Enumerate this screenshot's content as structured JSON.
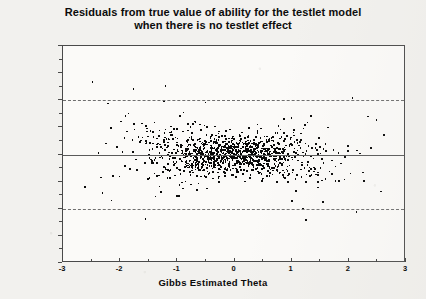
{
  "chart_data": {
    "type": "scatter",
    "title": "Residuals from true value of ability for the testlet model when there is no testlet effect",
    "title_line1": "Residuals from true value of ability for the testlet model",
    "title_line2": "when there is no testlet effect",
    "xlabel": "Gibbs Estimated Theta",
    "ylabel": "Estimated theta MINUS True Theta",
    "xlim": [
      -3,
      3
    ],
    "ylim": [
      -2.0,
      2.0
    ],
    "xticks": [
      -3,
      -2,
      -1,
      0,
      1,
      2,
      3
    ],
    "xticklabels": [
      "-3",
      "-2",
      "-1",
      "0",
      "1",
      "2",
      "3"
    ],
    "yticks": [
      -2.0,
      -1.5,
      -1.0,
      -0.5,
      0.0,
      0.5,
      1.0,
      1.5,
      2.0
    ],
    "yticklabels": [
      "-2.0",
      "-1.5",
      "-1.0",
      "-0.5",
      "0.0",
      "0.5",
      "1.0",
      "1.5",
      "2.0"
    ],
    "x_minor_ticks": [
      -2.5,
      -1.5,
      -0.5,
      0.5,
      1.5,
      2.5
    ],
    "y_minor_ticks": [
      -1.75,
      -1.25,
      -0.75,
      -0.25,
      0.25,
      0.75,
      1.25,
      1.75
    ],
    "grid": false,
    "legend": null,
    "marker": "square",
    "marker_size_px": 1.6,
    "marker_color": "#0a0a0a",
    "reference_lines": [
      {
        "y": 1.0,
        "style": "dashed",
        "color": "#6e6e6e",
        "label": "+1.0 residual band"
      },
      {
        "y": 0.0,
        "style": "solid",
        "color": "#5a5a5a",
        "label": "zero residual"
      },
      {
        "y": -1.0,
        "style": "dashed",
        "color": "#6e6e6e",
        "label": "-1.0 residual band"
      }
    ],
    "n_points": 900,
    "x": [
      -2.62,
      -2.48,
      -2.41,
      -2.33,
      -2.3,
      -2.26,
      -2.22,
      -2.19,
      -2.16,
      -2.12,
      -2.09,
      -2.06,
      -2.03,
      -2.0,
      -1.98,
      -1.95,
      -1.93,
      -1.9,
      -1.88,
      -1.86,
      -1.84,
      -1.82,
      -1.8,
      -1.78,
      -1.76,
      -1.74,
      -1.72,
      -1.7,
      -1.68,
      -1.67,
      -1.65,
      -1.63,
      -1.62,
      -1.6,
      -1.58,
      -1.57,
      -1.55,
      -1.54,
      -1.52,
      -1.51,
      -1.49,
      -1.48,
      -1.46,
      -1.45,
      -1.44,
      -1.42,
      -1.41,
      -1.4,
      -1.38,
      -1.37,
      -1.36,
      -1.35,
      -1.33,
      -1.32,
      -1.31,
      -1.3,
      -1.29,
      -1.27,
      -1.26,
      -1.25,
      -1.24,
      -1.23,
      -1.22,
      -1.21,
      -1.2,
      -1.19,
      -1.18,
      -1.17,
      -1.16,
      -1.15,
      -1.14,
      -1.13,
      -1.12,
      -1.11,
      -1.1,
      -1.09,
      -1.08,
      -1.07,
      -1.06,
      -1.05,
      -1.04,
      -1.03,
      -1.02,
      -1.01,
      -1.0,
      -0.99,
      -0.98,
      -0.97,
      -0.97,
      -0.96,
      -0.95,
      -0.94,
      -0.93,
      -0.92,
      -0.91,
      -0.9,
      -0.9,
      -0.89,
      -0.88,
      -0.87,
      -0.86,
      -0.85,
      -0.85,
      -0.84,
      -0.83,
      -0.82,
      -0.81,
      -0.81,
      -0.8,
      -0.79,
      -0.78,
      -0.78,
      -0.77,
      -0.76,
      -0.75,
      -0.75,
      -0.74,
      -0.73,
      -0.72,
      -0.72,
      -0.71,
      -0.7,
      -0.7,
      -0.69,
      -0.68,
      -0.67,
      -0.67,
      -0.66,
      -0.65,
      -0.65,
      -0.64,
      -0.63,
      -0.63,
      -0.62,
      -0.61,
      -0.61,
      -0.6,
      -0.59,
      -0.59,
      -0.58,
      -0.57,
      -0.57,
      -0.56,
      -0.55,
      -0.55,
      -0.54,
      -0.53,
      -0.53,
      -0.52,
      -0.52,
      -0.51,
      -0.5,
      -0.5,
      -0.49,
      -0.48,
      -0.48,
      -0.47,
      -0.47,
      -0.46,
      -0.45,
      -0.45,
      -0.44,
      -0.44,
      -0.43,
      -0.42,
      -0.42,
      -0.41,
      -0.41,
      -0.4,
      -0.39,
      -0.39,
      -0.38,
      -0.38,
      -0.37,
      -0.36,
      -0.36,
      -0.35,
      -0.35,
      -0.34,
      -0.34,
      -0.33,
      -0.32,
      -0.32,
      -0.31,
      -0.31,
      -0.3,
      -0.3,
      -0.29,
      -0.28,
      -0.28,
      -0.27,
      -0.27,
      -0.26,
      -0.26,
      -0.25,
      -0.25,
      -0.24,
      -0.23,
      -0.23,
      -0.22,
      -0.22,
      -0.21,
      -0.21,
      -0.2,
      -0.2,
      -0.19,
      -0.18,
      -0.18,
      -0.17,
      -0.17,
      -0.16,
      -0.16,
      -0.15,
      -0.15,
      -0.14,
      -0.14,
      -0.13,
      -0.12,
      -0.12,
      -0.11,
      -0.11,
      -0.1,
      -0.1,
      -0.09,
      -0.09,
      -0.08,
      -0.08,
      -0.07,
      -0.06,
      -0.06,
      -0.05,
      -0.05,
      -0.04,
      -0.04,
      -0.03,
      -0.03,
      -0.02,
      -0.02,
      -0.01,
      0.0,
      0.0,
      0.01,
      0.01,
      0.02,
      0.02,
      0.03,
      0.03,
      0.04,
      0.04,
      0.05,
      0.06,
      0.06,
      0.07,
      0.07,
      0.08,
      0.08,
      0.09,
      0.09,
      0.1,
      0.1,
      0.11,
      0.12,
      0.12,
      0.13,
      0.13,
      0.14,
      0.14,
      0.15,
      0.15,
      0.16,
      0.17,
      0.17,
      0.18,
      0.18,
      0.19,
      0.19,
      0.2,
      0.2,
      0.21,
      0.22,
      0.22,
      0.23,
      0.23,
      0.24,
      0.24,
      0.25,
      0.26,
      0.26,
      0.27,
      0.27,
      0.28,
      0.28,
      0.29,
      0.3,
      0.3,
      0.31,
      0.31,
      0.32,
      0.32,
      0.33,
      0.34,
      0.34,
      0.35,
      0.35,
      0.36,
      0.37,
      0.37,
      0.38,
      0.38,
      0.39,
      0.4,
      0.4,
      0.41,
      0.41,
      0.42,
      0.43,
      0.43,
      0.44,
      0.45,
      0.45,
      0.46,
      0.46,
      0.47,
      0.48,
      0.48,
      0.49,
      0.5,
      0.5,
      0.51,
      0.52,
      0.52,
      0.53,
      0.54,
      0.54,
      0.55,
      0.56,
      0.56,
      0.57,
      0.58,
      0.58,
      0.59,
      0.6,
      0.6,
      0.61,
      0.62,
      0.63,
      0.63,
      0.64,
      0.65,
      0.65,
      0.66,
      0.67,
      0.68,
      0.68,
      0.69,
      0.7,
      0.71,
      0.71,
      0.72,
      0.73,
      0.74,
      0.74,
      0.75,
      0.76,
      0.77,
      0.78,
      0.78,
      0.79,
      0.8,
      0.81,
      0.82,
      0.83,
      0.83,
      0.84,
      0.85,
      0.86,
      0.87,
      0.88,
      0.89,
      0.9,
      0.91,
      0.92,
      0.93,
      0.94,
      0.95,
      0.96,
      0.97,
      0.98,
      0.99,
      1.0,
      1.01,
      1.02,
      1.03,
      1.04,
      1.05,
      1.07,
      1.08,
      1.09,
      1.1,
      1.11,
      1.13,
      1.14,
      1.15,
      1.17,
      1.18,
      1.19,
      1.21,
      1.22,
      1.24,
      1.25,
      1.27,
      1.28,
      1.3,
      1.31,
      1.33,
      1.35,
      1.36,
      1.38,
      1.4,
      1.42,
      1.43,
      1.45,
      1.47,
      1.49,
      1.51,
      1.53,
      1.55,
      1.57,
      1.6,
      1.62,
      1.64,
      1.67,
      1.69,
      1.72,
      1.74,
      1.77,
      1.8,
      1.83,
      1.86,
      1.89,
      1.92,
      1.96,
      1.99,
      2.03,
      2.07,
      2.11,
      2.16,
      2.21,
      2.26,
      2.32,
      2.38,
      2.45,
      2.53,
      2.62
    ],
    "y_sd_model": "sd(x) = 0.17 + 0.115*|x|^1.55, residuals approximately normal, mean 0",
    "y_extremes": [
      {
        "x": -1.78,
        "y": 1.22
      },
      {
        "x": -1.22,
        "y": 1.28
      },
      {
        "x": 2.12,
        "y": -1.04
      },
      {
        "x": -1.25,
        "y": 1.0
      },
      {
        "x": -0.52,
        "y": 0.97
      },
      {
        "x": 1.18,
        "y": -0.98
      }
    ]
  },
  "axes": {
    "plot_left_px": 62,
    "plot_top_px": 45,
    "plot_width_px": 343,
    "plot_height_px": 217
  }
}
